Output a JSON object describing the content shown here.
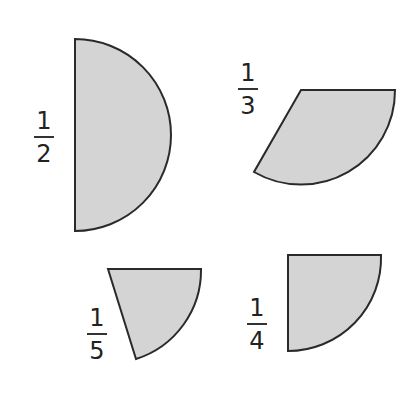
{
  "colors": {
    "fill": "#d4d4d4",
    "stroke": "#2a2a2a",
    "background": "#ffffff"
  },
  "shapes": [
    {
      "id": "half",
      "fraction": {
        "numerator": "1",
        "denominator": "2"
      },
      "description": "semicircle sector"
    },
    {
      "id": "third",
      "fraction": {
        "numerator": "1",
        "denominator": "3"
      },
      "description": "one-third circle sector"
    },
    {
      "id": "fifth",
      "fraction": {
        "numerator": "1",
        "denominator": "5"
      },
      "description": "one-fifth circle sector"
    },
    {
      "id": "quarter",
      "fraction": {
        "numerator": "1",
        "denominator": "4"
      },
      "description": "quarter circle sector"
    }
  ]
}
